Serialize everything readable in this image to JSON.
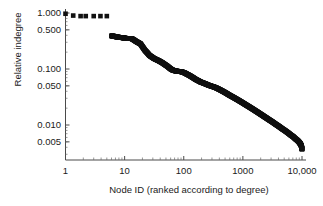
{
  "chart_data": {
    "type": "scatter",
    "title": "",
    "xlabel": "Node ID (ranked according to degree)",
    "ylabel": "Relative indegree",
    "xscale": "log",
    "yscale": "log",
    "xlim": [
      1,
      10000
    ],
    "ylim": [
      0.0035,
      1.15
    ],
    "grid": false,
    "legend": null,
    "xticks": [
      {
        "value": 1,
        "label": "1"
      },
      {
        "value": 10,
        "label": "10"
      },
      {
        "value": 100,
        "label": "100"
      },
      {
        "value": 1000,
        "label": "1000"
      },
      {
        "value": 10000,
        "label": "10,000"
      }
    ],
    "yticks": [
      {
        "value": 1.0,
        "label": "1.000"
      },
      {
        "value": 0.5,
        "label": "0.500"
      },
      {
        "value": 0.1,
        "label": "0.100"
      },
      {
        "value": 0.05,
        "label": "0.050"
      },
      {
        "value": 0.01,
        "label": "0.010"
      },
      {
        "value": 0.005,
        "label": "0.005"
      }
    ],
    "marker": {
      "shape": "square",
      "color": "#111111",
      "size": 2.3
    },
    "series": [
      {
        "name": "Relative indegree by rank",
        "x": [
          1,
          1.35,
          1.8,
          2.2,
          3.0,
          3.9,
          5.0,
          6.0,
          6.6,
          7.2,
          7.9,
          8.6,
          9.4,
          10.2,
          11.1,
          12.1,
          13.2,
          14.4,
          15.7,
          17.1,
          18.6,
          20.3,
          22.1,
          24.1,
          26.3,
          28.6,
          31.2,
          34.0,
          37.1,
          40.4,
          44.0,
          48.0,
          52.3,
          57.0,
          62.1,
          67.7,
          73.8,
          80.4,
          87.6,
          95.5,
          104,
          113,
          124,
          135,
          147,
          160,
          175,
          190,
          207,
          226,
          246,
          268,
          292,
          319,
          347,
          378,
          412,
          449,
          490,
          534,
          582,
          634,
          691,
          753,
          821,
          895,
          975,
          1063,
          1158,
          1262,
          1376,
          1500,
          1635,
          1782,
          1942,
          2117,
          2307,
          2515,
          2741,
          2988,
          3257,
          3550,
          3869,
          4217,
          4597,
          5011,
          5462,
          5954,
          6490,
          7074,
          7712,
          8405,
          9000,
          9400,
          9700,
          9900,
          10000
        ],
        "y": [
          0.97,
          0.9,
          0.88,
          0.88,
          0.88,
          0.88,
          0.88,
          0.39,
          0.385,
          0.375,
          0.37,
          0.365,
          0.36,
          0.355,
          0.352,
          0.35,
          0.348,
          0.33,
          0.31,
          0.295,
          0.28,
          0.245,
          0.215,
          0.195,
          0.175,
          0.165,
          0.155,
          0.148,
          0.142,
          0.135,
          0.128,
          0.12,
          0.113,
          0.105,
          0.098,
          0.094,
          0.092,
          0.091,
          0.09,
          0.088,
          0.085,
          0.081,
          0.077,
          0.073,
          0.069,
          0.065,
          0.062,
          0.059,
          0.057,
          0.055,
          0.053,
          0.051,
          0.0495,
          0.048,
          0.0465,
          0.0445,
          0.0425,
          0.0405,
          0.0385,
          0.0365,
          0.0345,
          0.0328,
          0.0312,
          0.0296,
          0.0281,
          0.0266,
          0.0252,
          0.0238,
          0.0225,
          0.0213,
          0.0201,
          0.019,
          0.0179,
          0.0169,
          0.0159,
          0.015,
          0.0141,
          0.0133,
          0.0125,
          0.0118,
          0.0111,
          0.0104,
          0.0098,
          0.0092,
          0.0086,
          0.0081,
          0.0076,
          0.0071,
          0.0066,
          0.0062,
          0.0057,
          0.0053,
          0.0049,
          0.0046,
          0.0043,
          0.004,
          0.0037
        ]
      }
    ]
  }
}
